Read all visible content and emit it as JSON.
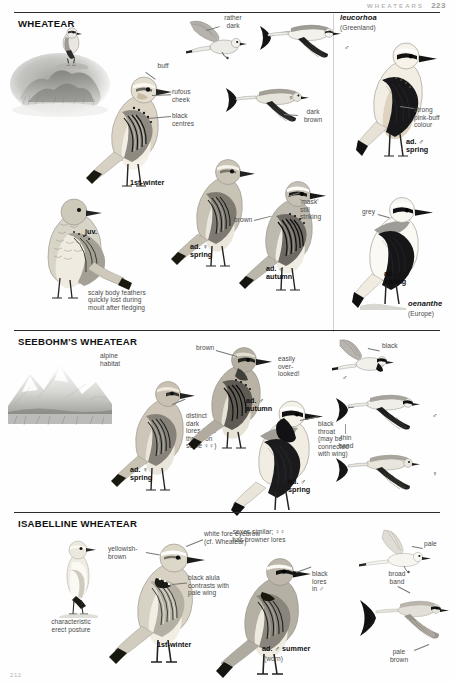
{
  "header": {
    "running_title": "WHEATEARS",
    "page_number": "223"
  },
  "folio": "212",
  "sections": [
    {
      "id": "wheatear",
      "title": "WHEATEAR",
      "subspecies_panel": {
        "name": "leucorhoa",
        "region": "(Greenland)"
      },
      "labels": [
        "buff",
        "rufous cheek",
        "black centres",
        "brown-grey",
        "rather dark",
        "dark brown",
        "strong pink-buff colour",
        "'mask' still striking",
        "brown",
        "grey",
        "scaly body feathers quickly lost during moult after fledging"
      ],
      "age_labels": [
        "1st-winter",
        "juv.",
        "ad. ♀ spring",
        "ad. ♂ autumn",
        "ad. ♂ spring",
        "ad. ♂ spring"
      ],
      "race_label": {
        "name": "oenanthe",
        "region": "(Europe)"
      },
      "sex_symbols": [
        "♂",
        "♀"
      ]
    },
    {
      "id": "seebohms",
      "title": "SEEBOHM'S WHEATEAR",
      "labels": [
        "alpine habitat",
        "brown",
        "easily over-looked!",
        "black",
        "distinct dark lores (and throat on some ♀♀)",
        "black throat (may be connected with wing)",
        "thin band"
      ],
      "age_labels": [
        "ad. ♀ spring",
        "ad. ♂ autumn",
        "ad. ♂ spring"
      ],
      "sex_symbols": [
        "♂",
        "♀"
      ]
    },
    {
      "id": "isabelline",
      "title": "ISABELLINE WHEATEAR",
      "labels": [
        "characteristic erect posture",
        "yellowish-brown",
        "white fore eyebrow (cf. Wheatear)",
        "black alula contrasts with pale wing",
        "sexes similar; ♀♀ has browner lores",
        "black lores in ♂",
        "pale",
        "broad band",
        "pale brown"
      ],
      "age_labels": [
        "1st-winter",
        "ad. ♂ summer",
        "(worn)"
      ]
    }
  ],
  "label_text": {
    "buff": "buff",
    "rufous_cheek": "rufous\ncheek",
    "black_centres": "black\ncentres",
    "brown_grey": "brown-\ngrey",
    "rather_dark": "rather\ndark",
    "dark_brown": "dark\nbrown",
    "pink_buff": "strong\npink-buff\ncolour",
    "mask": "'mask'\nstill\nstriking",
    "brown": "brown",
    "grey": "grey",
    "scaly": "scaly body feathers\nquickly lost during\nmoult after fledging",
    "alpine": "alpine\nhabitat",
    "brown2": "brown",
    "overlooked": "easily\nover-\nlooked!",
    "black": "black",
    "distinct_lores": "distinct\ndark\nlores (and\nthroat on\nsome ♀♀)",
    "black_throat": "black\nthroat\n(may be\nconnected\nwith wing)",
    "thin_band": "thin\nband",
    "erect": "characteristic\nerect posture",
    "yellowish": "yellowish-\nbrown",
    "fore_eyebrow": "white fore eyebrow\n(cf. Wheatear)",
    "black_alula": "black alula\ncontrasts with\npale wing",
    "sexes_similar": "sexes similar; ♀♀\nhas browner lores",
    "black_lores": "black\nlores\nin ♂",
    "pale": "pale",
    "broad_band": "broad\nband",
    "pale_brown": "pale\nbrown"
  },
  "age_text": {
    "first_winter_a": "1st-winter",
    "juv": "juv.",
    "ad_f_spring_a": "ad. ♀\nspring",
    "ad_m_autumn_a": "ad. ♂\nautumn",
    "ad_m_spring_leu": "ad. ♂\nspring",
    "ad_m_spring_oen": "ad. ♂\nspring",
    "ad_f_spring_b": "ad. ♀\nspring",
    "ad_m_autumn_b": "ad. ♂\nautumn",
    "ad_m_spring_b": "ad. ♂\nspring",
    "first_winter_b": "1st-winter",
    "ad_m_summer": "ad. ♂ summer",
    "worn": "(worn)"
  },
  "taxa": {
    "leucorhoa": "leucorhoa",
    "leucorhoa_region": "(Greenland)",
    "oenanthe": "oenanthe",
    "oenanthe_region": "(Europe)"
  },
  "sex": {
    "male": "♂",
    "female": "♀"
  },
  "colors": {
    "ink": "#1a1a1a",
    "label": "#4a4a4a",
    "rule": "#2b2b2b",
    "plumage_grey": "#9a9a98",
    "plumage_buff": "#cfc4b4",
    "plumage_dark": "#2e2e2e",
    "paper": "#fefefe"
  }
}
